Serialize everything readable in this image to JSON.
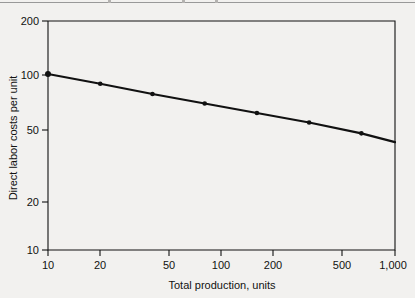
{
  "figure": {
    "background_color": "#f2f1ef",
    "ink_color": "#111111",
    "page_rule_color": "#8a8a8a"
  },
  "chart_data": {
    "type": "line",
    "title": "",
    "subtitle": "",
    "xlabel": "Total production, units",
    "ylabel": "Direct labor costs per unit",
    "xscale": "log",
    "yscale": "log",
    "xlim": [
      10,
      1000
    ],
    "ylim": [
      10,
      200
    ],
    "grid": false,
    "legend": false,
    "legend_position": "none",
    "xticks": [
      10,
      20,
      50,
      100,
      200,
      500,
      1000
    ],
    "xtick_labels": [
      "10",
      "20",
      "50",
      "100",
      "200",
      "500",
      "1,000"
    ],
    "yticks": [
      10,
      20,
      50,
      100,
      200
    ],
    "ytick_labels": [
      "10",
      "20",
      "50",
      "100",
      "200"
    ],
    "series": [
      {
        "name": "Direct labor costs per unit",
        "marker": "dot",
        "line_color": "#111111",
        "line_width": 2.2,
        "x": [
          10,
          20,
          40,
          80,
          160,
          320,
          640,
          1000
        ],
        "values": [
          100,
          88,
          77,
          68,
          60,
          53,
          46,
          41
        ]
      }
    ],
    "annotations": []
  },
  "axis": {
    "x_title": "Total production, units",
    "y_title": "Direct labor costs per unit",
    "x_tick_labels": [
      "10",
      "20",
      "50",
      "100",
      "200",
      "500",
      "1,000"
    ],
    "y_tick_labels": [
      "200",
      "100",
      "50",
      "20",
      "10"
    ]
  }
}
